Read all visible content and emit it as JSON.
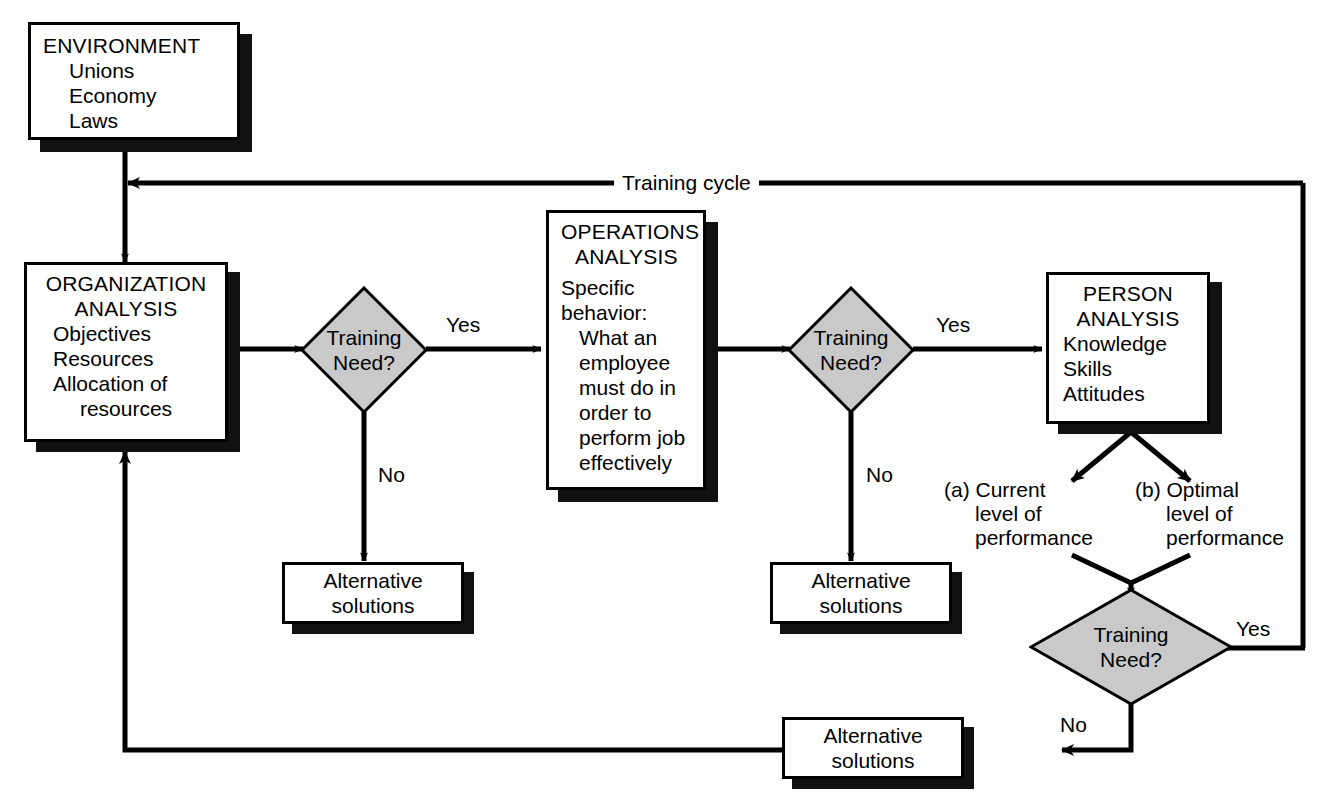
{
  "diagram": {
    "colors": {
      "line": "#000000",
      "box_fill": "#ffffff",
      "box_border": "#000000",
      "shadow": "#111111",
      "diamond_fill": "#c9c9c9",
      "background": "#fdfdfd"
    },
    "nodes": {
      "environment": {
        "title": "ENVIRONMENT",
        "items": [
          "Unions",
          "Economy",
          "Laws"
        ]
      },
      "organization": {
        "title_line1": "ORGANIZATION",
        "title_line2": "ANALYSIS",
        "items": [
          "Objectives",
          "Resources",
          "Allocation of",
          "resources"
        ]
      },
      "operations": {
        "title_line1": "OPERATIONS",
        "title_line2": "ANALYSIS",
        "line1": "Specific",
        "line2": "behavior:",
        "line3": "What an",
        "line4": "employee",
        "line5": "must do in",
        "line6": "order to",
        "line7": "perform job",
        "line8": "effectively"
      },
      "person": {
        "title_line1": "PERSON",
        "title_line2": "ANALYSIS",
        "items": [
          "Knowledge",
          "Skills",
          "Attitudes"
        ]
      },
      "alt1": {
        "line1": "Alternative",
        "line2": "solutions"
      },
      "alt2": {
        "line1": "Alternative",
        "line2": "solutions"
      },
      "alt3": {
        "line1": "Alternative",
        "line2": "solutions"
      }
    },
    "decisions": {
      "d1": {
        "line1": "Training",
        "line2": "Need?"
      },
      "d2": {
        "line1": "Training",
        "line2": "Need?"
      },
      "d3": {
        "line1": "Training",
        "line2": "Need?"
      }
    },
    "edge_labels": {
      "training_cycle": "Training cycle",
      "yes1": "Yes",
      "no1": "No",
      "yes2": "Yes",
      "no2": "No",
      "yes3": "Yes",
      "no3": "No"
    },
    "outcomes": {
      "a": {
        "marker": "(a)",
        "line1": "Current",
        "line2": "level of",
        "line3": "performance"
      },
      "b": {
        "marker": "(b)",
        "line1": "Optimal",
        "line2": "level of",
        "line3": "performance"
      }
    }
  }
}
